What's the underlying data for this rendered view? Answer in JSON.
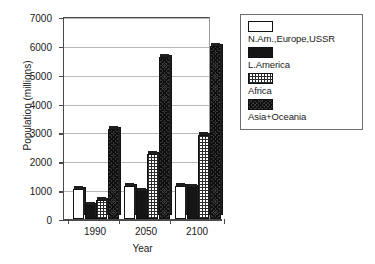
{
  "chart_data": {
    "type": "bar",
    "title": "",
    "subtitle": "",
    "xlabel": "Year",
    "ylabel": "Population (millions)",
    "categories": [
      "1990",
      "2050",
      "2100"
    ],
    "ylim": [
      0,
      7000
    ],
    "ytick_labels": [
      "0",
      "1000",
      "2000",
      "3000",
      "4000",
      "5000",
      "6000",
      "7000"
    ],
    "ytick_values": [
      0,
      1000,
      2000,
      3000,
      4000,
      5000,
      6000,
      7000
    ],
    "grid": "horizontal",
    "legend_position": "right-outside",
    "series": [
      {
        "name": "N.Am.,Europe,USSR",
        "fill": "white",
        "values": [
          1050,
          1130,
          1160
        ]
      },
      {
        "name": "L.America",
        "fill": "black",
        "values": [
          480,
          980,
          1100
        ]
      },
      {
        "name": "Africa",
        "fill": "grid",
        "values": [
          650,
          2250,
          2900
        ]
      },
      {
        "name": "Asia+Oceania",
        "fill": "xhatch",
        "values": [
          3120,
          5620,
          6000
        ]
      }
    ]
  },
  "colors": {
    "axis": "#4a4a4a",
    "grid": "#b9b9b9",
    "bar_outline": "#111111",
    "text": "#1a1a1a",
    "legend_border": "#6e6e6e",
    "background": "#ffffff"
  }
}
